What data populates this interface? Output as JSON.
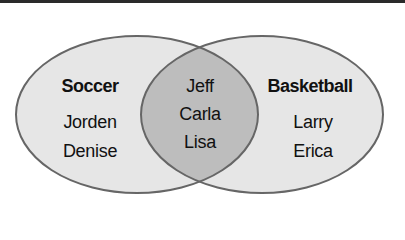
{
  "diagram": {
    "type": "venn",
    "colors": {
      "outer_fill": "#e6e6e6",
      "overlap_fill": "#bdbdbd",
      "stroke": "#666666",
      "top_rule": "#2a2a2a"
    },
    "sets": [
      {
        "title": "Soccer",
        "members_only": [
          "Jorden",
          "Denise"
        ]
      },
      {
        "title": "Basketball",
        "members_only": [
          "Larry",
          "Erica"
        ]
      }
    ],
    "intersection": {
      "members": [
        "Jeff",
        "Carla",
        "Lisa"
      ]
    }
  }
}
